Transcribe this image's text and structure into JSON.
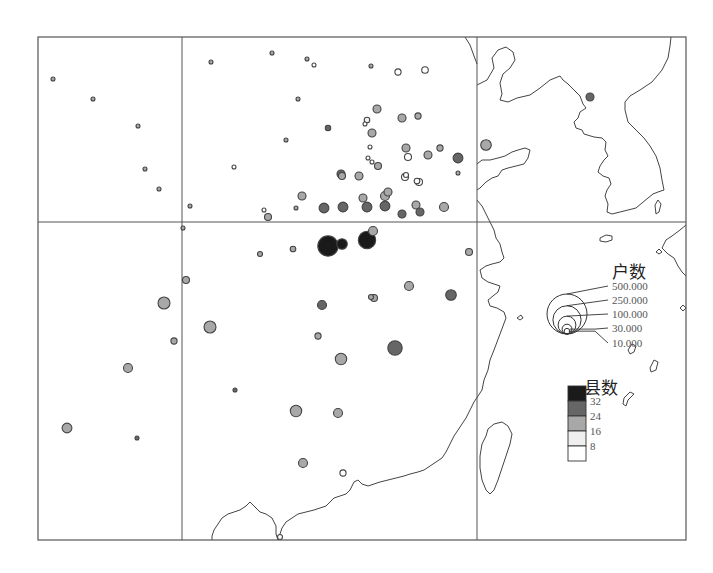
{
  "map": {
    "title": "",
    "size_legend": {
      "title": "户数",
      "values": [
        500000,
        250000,
        100000,
        30000,
        10000
      ],
      "labels": [
        "500.000",
        "250.000",
        "100.000",
        "30.000",
        "10.000"
      ]
    },
    "color_legend": {
      "title": "县数",
      "classes": [
        {
          "label": "",
          "color": "#1a1a1a"
        },
        {
          "label": "32",
          "color": "#666666"
        },
        {
          "label": "24",
          "color": "#a8a8a8"
        },
        {
          "label": "16",
          "color": "#efefef"
        },
        {
          "label": "8",
          "color": "#ffffff"
        }
      ]
    }
  },
  "chart_data": {
    "type": "scatter",
    "title": "",
    "subtitle": "",
    "encoding": {
      "size": "户数 (households)",
      "color": "县数 (number of counties)"
    },
    "legend_placement": "right",
    "grid": true,
    "points": [
      {
        "id": 1,
        "households": 3000,
        "class": 2
      },
      {
        "id": 2,
        "households": 1500,
        "class": 2
      },
      {
        "id": 3,
        "households": 1500,
        "class": 2
      },
      {
        "id": 4,
        "households": 1500,
        "class": 2
      },
      {
        "id": 5,
        "households": 700,
        "class": 2
      },
      {
        "id": 6,
        "households": 500,
        "class": 2
      },
      {
        "id": 7,
        "households": 500,
        "class": 4
      },
      {
        "id": 8,
        "households": 700,
        "class": 2
      },
      {
        "id": 9,
        "households": 600,
        "class": 2
      },
      {
        "id": 10,
        "households": 500,
        "class": 4
      },
      {
        "id": 11,
        "households": 4000,
        "class": 2
      },
      {
        "id": 12,
        "households": 1200,
        "class": 2
      },
      {
        "id": 13,
        "households": 1200,
        "class": 2
      },
      {
        "id": 14,
        "households": 500,
        "class": 2
      },
      {
        "id": 15,
        "households": 14000,
        "class": 4
      },
      {
        "id": 16,
        "households": 12000,
        "class": 4
      },
      {
        "id": 17,
        "households": 9000,
        "class": 1
      },
      {
        "id": 18,
        "households": 2000,
        "class": 2
      },
      {
        "id": 19,
        "households": 20000,
        "class": 2
      },
      {
        "id": 20,
        "households": 10000,
        "class": 3
      },
      {
        "id": 21,
        "households": 5000,
        "class": 4
      },
      {
        "id": 22,
        "households": 20000,
        "class": 2
      },
      {
        "id": 23,
        "households": 12000,
        "class": 2
      },
      {
        "id": 24,
        "households": 5000,
        "class": 4
      },
      {
        "id": 25,
        "households": 20000,
        "class": 2
      },
      {
        "id": 26,
        "households": 20000,
        "class": 2
      },
      {
        "id": 27,
        "households": 35000,
        "class": 2
      },
      {
        "id": 28,
        "households": 15000,
        "class": 2
      },
      {
        "id": 29,
        "households": 8000,
        "class": 4
      },
      {
        "id": 30,
        "households": 30000,
        "class": 1
      },
      {
        "id": 31,
        "households": 12000,
        "class": 2
      },
      {
        "id": 32,
        "households": 1500,
        "class": 2
      },
      {
        "id": 33,
        "households": 15000,
        "class": 4
      },
      {
        "id": 34,
        "households": 10000,
        "class": 4
      },
      {
        "id": 35,
        "households": 20000,
        "class": 2
      },
      {
        "id": 36,
        "households": 25000,
        "class": 2
      },
      {
        "id": 37,
        "households": 3000,
        "class": 4
      },
      {
        "id": 38,
        "households": 3000,
        "class": 4
      },
      {
        "id": 39,
        "households": 20000,
        "class": 2
      },
      {
        "id": 40,
        "households": 20000,
        "class": 2
      },
      {
        "id": 41,
        "households": 20000,
        "class": 1
      },
      {
        "id": 42,
        "households": 4000,
        "class": 2
      },
      {
        "id": 43,
        "households": 35000,
        "class": 0
      },
      {
        "id": 44,
        "households": 15000,
        "class": 2
      },
      {
        "id": 45,
        "households": 15000,
        "class": 4
      },
      {
        "id": 46,
        "households": 15000,
        "class": 4
      },
      {
        "id": 47,
        "households": 20000,
        "class": 2
      },
      {
        "id": 48,
        "households": 30000,
        "class": 1
      },
      {
        "id": 49,
        "households": 30000,
        "class": 1
      },
      {
        "id": 50,
        "households": 30000,
        "class": 1
      },
      {
        "id": 51,
        "households": 30000,
        "class": 1
      },
      {
        "id": 52,
        "households": 20000,
        "class": 2
      },
      {
        "id": 53,
        "households": 20000,
        "class": 2
      },
      {
        "id": 54,
        "households": 20000,
        "class": 1
      },
      {
        "id": 55,
        "households": 20000,
        "class": 1
      },
      {
        "id": 56,
        "households": 25000,
        "class": 2
      },
      {
        "id": 57,
        "households": 130000,
        "class": 0
      },
      {
        "id": 58,
        "households": 95000,
        "class": 0
      },
      {
        "id": 59,
        "households": 25000,
        "class": 2
      },
      {
        "id": 60,
        "households": 8000,
        "class": 2
      },
      {
        "id": 61,
        "households": 10000,
        "class": 2
      },
      {
        "id": 62,
        "households": 15000,
        "class": 2
      },
      {
        "id": 63,
        "households": 25000,
        "class": 1
      },
      {
        "id": 64,
        "households": 15000,
        "class": 2
      },
      {
        "id": 65,
        "households": 25000,
        "class": 2
      },
      {
        "id": 66,
        "households": 3000,
        "class": 4
      },
      {
        "id": 67,
        "households": 15000,
        "class": 2
      },
      {
        "id": 68,
        "households": 45000,
        "class": 2
      },
      {
        "id": 69,
        "households": 15000,
        "class": 2
      },
      {
        "id": 70,
        "households": 45000,
        "class": 2
      },
      {
        "id": 71,
        "households": 12000,
        "class": 2
      },
      {
        "id": 72,
        "households": 35000,
        "class": 1
      },
      {
        "id": 73,
        "households": 8000,
        "class": 2
      },
      {
        "id": 74,
        "households": 40000,
        "class": 2
      },
      {
        "id": 75,
        "households": 65000,
        "class": 1
      },
      {
        "id": 76,
        "households": 12000,
        "class": 2
      },
      {
        "id": 77,
        "households": 3000,
        "class": 1
      },
      {
        "id": 78,
        "households": 40000,
        "class": 2
      },
      {
        "id": 79,
        "households": 25000,
        "class": 2
      },
      {
        "id": 80,
        "households": 3000,
        "class": 1
      },
      {
        "id": 81,
        "households": 30000,
        "class": 2
      },
      {
        "id": 82,
        "households": 25000,
        "class": 2
      },
      {
        "id": 83,
        "households": 25000,
        "class": 2
      },
      {
        "id": 84,
        "households": 12000,
        "class": 4
      },
      {
        "id": 85,
        "households": 8000,
        "class": 4
      },
      {
        "id": 86,
        "households": 20000,
        "class": 1
      }
    ]
  }
}
